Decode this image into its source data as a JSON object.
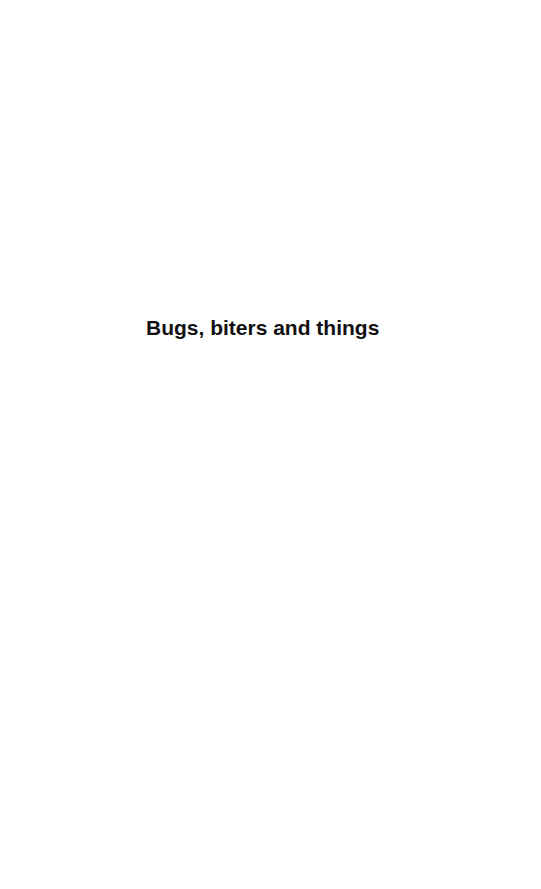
{
  "page": {
    "title": "Bugs, biters and things",
    "background_color": "#ffffff",
    "text_color": "#111111"
  }
}
